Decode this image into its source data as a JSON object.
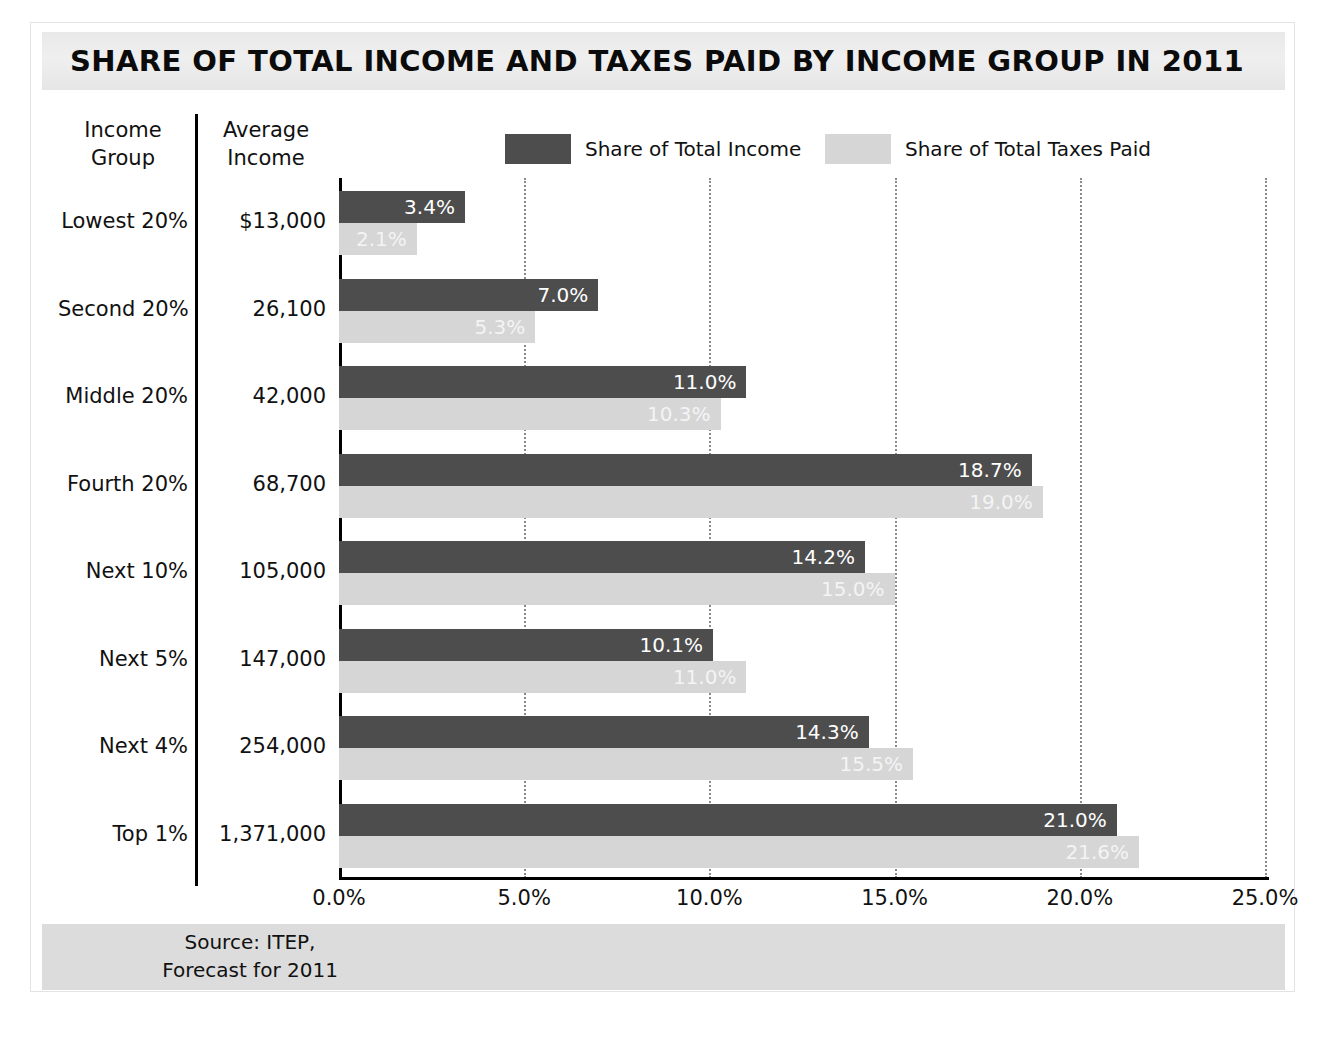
{
  "title": "SHARE OF TOTAL INCOME AND TAXES PAID BY INCOME GROUP IN 2011",
  "table_headers": {
    "group": "Income\nGroup",
    "group_line1": "Income",
    "group_line2": "Group",
    "average_line1": "Average",
    "average_line2": "Income"
  },
  "legend": {
    "income_label": "Share of Total Income",
    "taxes_label": "Share of Total Taxes Paid"
  },
  "source": {
    "line1": "Source: ITEP,",
    "line2": "Forecast for 2011"
  },
  "colors": {
    "income_bar": "#4d4d4d",
    "taxes_bar": "#d6d6d6",
    "title_band": "#e9e9e9",
    "source_band": "#dcdcdc",
    "gridline": "#8a8a8a",
    "axis": "#000000"
  },
  "chart_data": {
    "type": "bar",
    "orientation": "horizontal",
    "title": "SHARE OF TOTAL INCOME AND TAXES PAID BY INCOME GROUP IN 2011",
    "xlabel": "",
    "ylabel": "",
    "xlim": [
      0,
      25
    ],
    "xticks": [
      0,
      5,
      10,
      15,
      20,
      25
    ],
    "xtick_labels": [
      "0.0%",
      "5.0%",
      "10.0%",
      "15.0%",
      "20.0%",
      "25.0%"
    ],
    "grid": true,
    "grid_axis": "x",
    "legend_position": "top",
    "categories": [
      "Lowest 20%",
      "Second 20%",
      "Middle 20%",
      "Fourth 20%",
      "Next 10%",
      "Next 5%",
      "Next 4%",
      "Top 1%"
    ],
    "average_income": [
      "$13,000",
      "26,100",
      "42,000",
      "68,700",
      "105,000",
      "147,000",
      "254,000",
      "1,371,000"
    ],
    "series": [
      {
        "name": "Share of Total Income",
        "color": "#4d4d4d",
        "values": [
          3.4,
          7.0,
          11.0,
          18.7,
          14.2,
          10.1,
          14.3,
          21.0
        ],
        "labels": [
          "3.4%",
          "7.0%",
          "11.0%",
          "18.7%",
          "14.2%",
          "10.1%",
          "14.3%",
          "21.0%"
        ]
      },
      {
        "name": "Share of Total Taxes Paid",
        "color": "#d6d6d6",
        "values": [
          2.1,
          5.3,
          10.3,
          19.0,
          15.0,
          11.0,
          15.5,
          21.6
        ],
        "labels": [
          "2.1%",
          "5.3%",
          "10.3%",
          "19.0%",
          "15.0%",
          "11.0%",
          "15.5%",
          "21.6%"
        ]
      }
    ]
  }
}
